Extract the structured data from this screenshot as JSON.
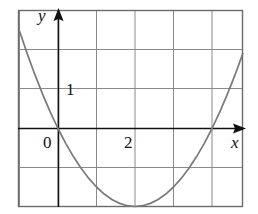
{
  "figure": {
    "background": "#ffffff",
    "frame_color": "#6b6b6b",
    "grid_color": "#8a8a8a",
    "axis_color": "#111111",
    "curve_color": "#7a7a7a",
    "label_color": "#111111"
  },
  "labels": {
    "y_axis": "y",
    "x_axis": "x",
    "origin": "0",
    "y_tick_1": "1",
    "x_tick_2": "2"
  },
  "chart_data": {
    "type": "line",
    "title": "",
    "xlabel": "x",
    "ylabel": "y",
    "grid": true,
    "legend": "none",
    "xlim": [
      -1,
      5
    ],
    "ylim": [
      -2.5,
      2.5
    ],
    "xticks": [
      0,
      2
    ],
    "yticks": [
      1
    ],
    "xtick_labels": [
      "0",
      "2"
    ],
    "ytick_labels": [
      "1"
    ],
    "grid_columns": 6,
    "grid_rows": 5,
    "grid_x_lines": [
      -1,
      0,
      1,
      2,
      3,
      4,
      5
    ],
    "grid_y_lines": [
      -2.5,
      -1.5,
      -0.5,
      0.5,
      1.5,
      2.5
    ],
    "series": [
      {
        "name": "parabola",
        "equation": "y = 0.5x(x - 4)",
        "roots": [
          0,
          4
        ],
        "vertex": [
          2,
          -2
        ],
        "x": [
          -1.0,
          -0.8,
          -0.6,
          -0.4,
          -0.2,
          0.0,
          0.2,
          0.4,
          0.6,
          0.8,
          1.0,
          1.2,
          1.4,
          1.6,
          1.8,
          2.0,
          2.2,
          2.4,
          2.6,
          2.8,
          3.0,
          3.2,
          3.4,
          3.6,
          3.8,
          4.0,
          4.2,
          4.4,
          4.6,
          4.8,
          5.0
        ],
        "y": [
          2.5,
          1.92,
          1.38,
          0.88,
          0.42,
          0.0,
          -0.38,
          -0.72,
          -1.02,
          -1.28,
          -1.5,
          -1.68,
          -1.82,
          -1.92,
          -1.98,
          -2.0,
          -1.98,
          -1.92,
          -1.82,
          -1.68,
          -1.5,
          -1.28,
          -1.02,
          -0.72,
          -0.38,
          0.0,
          0.42,
          0.88,
          1.38,
          1.92,
          2.5
        ]
      }
    ]
  }
}
